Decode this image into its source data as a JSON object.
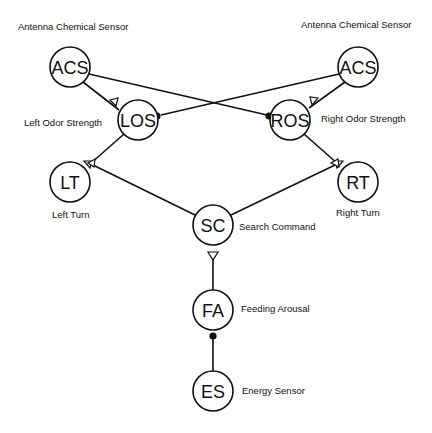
{
  "diagram": {
    "type": "neural-circuit",
    "nodes": [
      {
        "id": "acs_left",
        "abbr": "ACS",
        "label": "Antenna Chemical Sensor",
        "cx": 70,
        "cy": 67
      },
      {
        "id": "acs_right",
        "abbr": "ACS",
        "label": "Antenna Chemical Sensor",
        "cx": 358,
        "cy": 67
      },
      {
        "id": "los",
        "abbr": "LOS",
        "label": "Left Odor Strength",
        "cx": 138,
        "cy": 120
      },
      {
        "id": "ros",
        "abbr": "ROS",
        "label": "Right Odor Strength",
        "cx": 290,
        "cy": 120
      },
      {
        "id": "lt",
        "abbr": "LT",
        "label": "Left Turn",
        "cx": 70,
        "cy": 182
      },
      {
        "id": "rt",
        "abbr": "RT",
        "label": "Right Turn",
        "cx": 358,
        "cy": 182
      },
      {
        "id": "sc",
        "abbr": "SC",
        "label": "Search Command",
        "cx": 213,
        "cy": 225
      },
      {
        "id": "fa",
        "abbr": "FA",
        "label": "Feeding Arousal",
        "cx": 213,
        "cy": 310
      },
      {
        "id": "es",
        "abbr": "ES",
        "label": "Energy Sensor",
        "cx": 213,
        "cy": 391
      }
    ],
    "edges": [
      {
        "from": "acs_left",
        "to": "los",
        "type": "excitatory"
      },
      {
        "from": "acs_left",
        "to": "ros",
        "type": "inhibitory"
      },
      {
        "from": "acs_right",
        "to": "ros",
        "type": "excitatory"
      },
      {
        "from": "acs_right",
        "to": "los",
        "type": "inhibitory"
      },
      {
        "from": "los",
        "to": "lt",
        "type": "excitatory"
      },
      {
        "from": "ros",
        "to": "rt",
        "type": "excitatory"
      },
      {
        "from": "sc",
        "to": "lt",
        "type": "excitatory"
      },
      {
        "from": "sc",
        "to": "rt",
        "type": "excitatory"
      },
      {
        "from": "fa",
        "to": "sc",
        "type": "excitatory"
      },
      {
        "from": "es",
        "to": "fa",
        "type": "inhibitory"
      }
    ],
    "legend": {
      "excitatory_symbol": "open-triangle",
      "inhibitory_symbol": "filled-dot"
    }
  }
}
